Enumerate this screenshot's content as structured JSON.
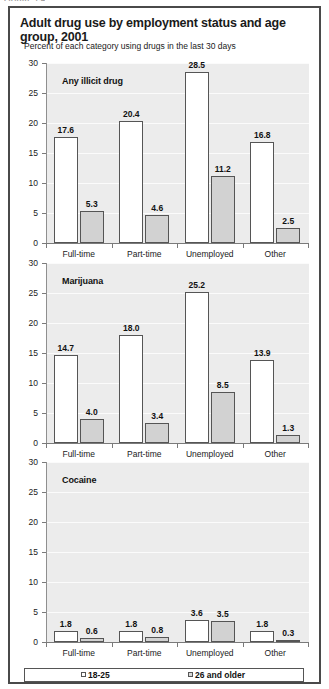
{
  "clipped_header": "FIGURE 1.4",
  "title": "Adult drug use by employment status and age group, 2001",
  "subtitle": "Percent of each category using drugs in the last 30 days",
  "legend": {
    "items": [
      {
        "label": "18-25",
        "swatch": "white-square-icon"
      },
      {
        "label": "26 and older",
        "swatch": "gray-square-icon"
      }
    ]
  },
  "chart_data": {
    "type": "bar",
    "title": "Adult drug use by employment status and age group, 2001",
    "subtitle": "Percent of each category using drugs in the last 30 days",
    "xlabel": "",
    "ylabel": "Percent",
    "ylim": [
      0,
      30
    ],
    "yticks": [
      0,
      5,
      10,
      15,
      20,
      25,
      30
    ],
    "grid": true,
    "legend_position": "bottom",
    "categories": [
      "Full-time",
      "Part-time",
      "Unemployed",
      "Other"
    ],
    "panels": [
      {
        "name": "Any illicit drug",
        "series": [
          {
            "name": "18-25",
            "values": [
              17.6,
              20.4,
              28.5,
              16.8
            ]
          },
          {
            "name": "26 and older",
            "values": [
              5.3,
              4.6,
              11.2,
              2.5
            ]
          }
        ]
      },
      {
        "name": "Marijuana",
        "series": [
          {
            "name": "18-25",
            "values": [
              14.7,
              18.0,
              25.2,
              13.9
            ]
          },
          {
            "name": "26 and older",
            "values": [
              4.0,
              3.4,
              8.5,
              1.3
            ]
          }
        ]
      },
      {
        "name": "Cocaine",
        "series": [
          {
            "name": "18-25",
            "values": [
              1.8,
              1.8,
              3.6,
              1.8
            ]
          },
          {
            "name": "26 and older",
            "values": [
              0.6,
              0.8,
              3.5,
              0.3
            ]
          }
        ]
      }
    ]
  }
}
